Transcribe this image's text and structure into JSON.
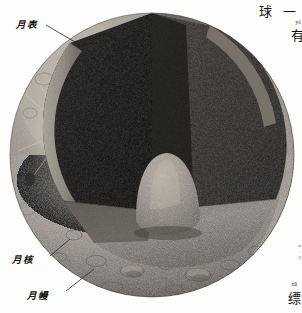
{
  "figure": {
    "name": "moon-internal-structure-cutaway",
    "view": "cutaway sphere with wedge removed",
    "background_color": "#fdfdfc"
  },
  "labels": [
    {
      "id": "lunar-surface",
      "text": "月表",
      "meaning": "lunar surface",
      "position": "top-left",
      "leader_line": true
    },
    {
      "id": "lunar-core",
      "text": "月核",
      "meaning": "lunar core",
      "position": "bottom-left",
      "leader_line": true
    },
    {
      "id": "lunar-mantle",
      "text": "月幔",
      "meaning": "lunar mantle",
      "position": "bottom-left",
      "leader_line": true
    }
  ],
  "page_edge_text": {
    "title": "球 一",
    "top_right_pinyin": "yǒ",
    "top_right_char": "有",
    "bottom_right_pinyin": "xū",
    "bottom_right_char": "缥",
    "margin_marks": [
      "a",
      "·",
      "2"
    ]
  },
  "colors": {
    "surface_light": "#b9b2a7",
    "surface_mid": "#8d877d",
    "surface_dark": "#57524b",
    "cut_face_dark": "#100f0e",
    "cut_face_mid": "#2c2a27",
    "core_light": "#9a9389",
    "label_ink": "#161310",
    "leader_line": "#2a2622"
  }
}
